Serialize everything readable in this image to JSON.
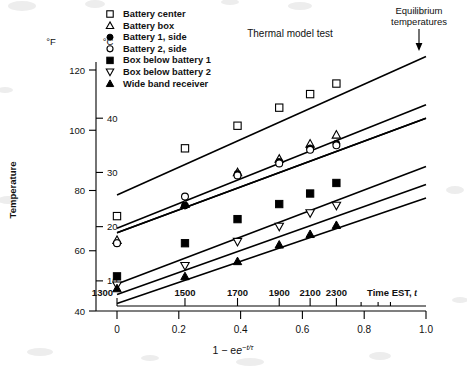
{
  "chart_data": {
    "type": "scatter",
    "title": "Thermal model test",
    "xlabel": "1 − e−t/τ",
    "xlabel_main": "1 − e",
    "xlabel_exp": "−t/τ",
    "ylabel": "Temperature",
    "y_axis_primary_unit": "°F",
    "y_axis_secondary_unit": "°C",
    "xlim": [
      -0.06,
      1.04
    ],
    "ylim_f": [
      40,
      126
    ],
    "grid": false,
    "legend_position": "top-left",
    "annotation": {
      "text_line1": "Equilibrium",
      "text_line2": "temperatures",
      "arrow": "down-arrow-to-curve-end"
    },
    "x_ticks": [
      {
        "value": 0,
        "label": "0"
      },
      {
        "value": 0.2,
        "label": "0.2"
      },
      {
        "value": 0.4,
        "label": "0.4"
      },
      {
        "value": 0.6,
        "label": "0.6"
      },
      {
        "value": 0.8,
        "label": "0.8"
      },
      {
        "value": 1.0,
        "label": "1.0"
      }
    ],
    "x_minor_ticks": [
      0.1,
      0.3,
      0.5,
      0.7,
      0.9
    ],
    "secondary_x_axis": {
      "label": "Time EST, t",
      "label_main": "Time EST,",
      "label_italic": "t",
      "ticks": [
        {
          "value": 0.0,
          "label": "1300"
        },
        {
          "value": 0.22,
          "label": "1500"
        },
        {
          "value": 0.39,
          "label": "1700"
        },
        {
          "value": 0.525,
          "label": "1900"
        },
        {
          "value": 0.625,
          "label": "2100"
        },
        {
          "value": 0.71,
          "label": "2300"
        }
      ],
      "extra_ticks": [
        0.79,
        0.845,
        0.885
      ]
    },
    "y_ticks_f": [
      {
        "value": 120,
        "label": "120"
      },
      {
        "value": 100,
        "label": "100"
      },
      {
        "value": 80,
        "label": "80"
      },
      {
        "value": 60,
        "label": "60"
      },
      {
        "value": 40,
        "label": "40"
      }
    ],
    "y_ticks_c": [
      {
        "value_f": 104,
        "value_c": 40,
        "label": "40"
      },
      {
        "value_f": 86,
        "value_c": 30,
        "label": "30"
      },
      {
        "value_f": 68,
        "value_c": 20,
        "label": "20"
      },
      {
        "value_f": 50,
        "value_c": 10,
        "label": "10"
      }
    ],
    "series": [
      {
        "name": "Battery center",
        "marker": "open-square",
        "line": {
          "x0": 0.0,
          "y0": 78.5,
          "x1": 1.0,
          "y1": 124.5
        },
        "points": [
          {
            "x": 0.0,
            "y": 71.5
          },
          {
            "x": 0.22,
            "y": 94.0
          },
          {
            "x": 0.39,
            "y": 101.5
          },
          {
            "x": 0.525,
            "y": 107.5
          },
          {
            "x": 0.625,
            "y": 112.0
          },
          {
            "x": 0.71,
            "y": 115.5
          }
        ]
      },
      {
        "name": "Battery box",
        "marker": "open-triangle-up",
        "line": {
          "x0": 0.0,
          "y0": 67.5,
          "x1": 1.0,
          "y1": 108.5
        },
        "points": [
          {
            "x": 0.0,
            "y": 63.5
          },
          {
            "x": 0.22,
            "y": 75.5
          },
          {
            "x": 0.39,
            "y": 86.0
          },
          {
            "x": 0.525,
            "y": 90.5
          },
          {
            "x": 0.625,
            "y": 95.5
          },
          {
            "x": 0.71,
            "y": 98.5
          }
        ]
      },
      {
        "name": "Battery 1, side",
        "marker": "filled-circle",
        "line": {
          "x0": 0.0,
          "y0": 66.0,
          "x1": 1.0,
          "y1": 104.0
        },
        "points": [
          {
            "x": 0.0,
            "y": 62.5
          },
          {
            "x": 0.22,
            "y": 75.0
          },
          {
            "x": 0.39,
            "y": 85.5
          },
          {
            "x": 0.525,
            "y": 89.5
          },
          {
            "x": 0.625,
            "y": 94.0
          },
          {
            "x": 0.71,
            "y": 95.5
          }
        ]
      },
      {
        "name": "Battery 2, side",
        "marker": "open-circle",
        "line": {
          "x0": 0.0,
          "y0": 66.0,
          "x1": 1.0,
          "y1": 104.0
        },
        "points": [
          {
            "x": 0.0,
            "y": 62.5
          },
          {
            "x": 0.22,
            "y": 78.0
          },
          {
            "x": 0.39,
            "y": 85.0
          },
          {
            "x": 0.525,
            "y": 89.0
          },
          {
            "x": 0.625,
            "y": 93.5
          },
          {
            "x": 0.71,
            "y": 95.0
          }
        ]
      },
      {
        "name": "Box below battery 1",
        "marker": "filled-square",
        "line": {
          "x0": 0.0,
          "y0": 49.0,
          "x1": 1.0,
          "y1": 88.0
        },
        "points": [
          {
            "x": 0.0,
            "y": 51.5
          },
          {
            "x": 0.22,
            "y": 62.5
          },
          {
            "x": 0.39,
            "y": 70.5
          },
          {
            "x": 0.525,
            "y": 75.5
          },
          {
            "x": 0.625,
            "y": 79.0
          },
          {
            "x": 0.71,
            "y": 82.5
          }
        ]
      },
      {
        "name": "Box below battery 2",
        "marker": "open-triangle-down",
        "line": {
          "x0": 0.0,
          "y0": 45.5,
          "x1": 1.0,
          "y1": 82.0
        },
        "points": [
          {
            "x": 0.0,
            "y": 48.5
          },
          {
            "x": 0.22,
            "y": 55.0
          },
          {
            "x": 0.39,
            "y": 63.0
          },
          {
            "x": 0.525,
            "y": 68.0
          },
          {
            "x": 0.625,
            "y": 72.5
          },
          {
            "x": 0.71,
            "y": 75.0
          }
        ]
      },
      {
        "name": "Wide band receiver",
        "marker": "filled-triangle-up",
        "line": {
          "x0": 0.0,
          "y0": 42.5,
          "x1": 1.0,
          "y1": 77.5
        },
        "points": [
          {
            "x": 0.0,
            "y": 47.5
          },
          {
            "x": 0.22,
            "y": 51.5
          },
          {
            "x": 0.39,
            "y": 56.5
          },
          {
            "x": 0.525,
            "y": 62.0
          },
          {
            "x": 0.625,
            "y": 65.5
          },
          {
            "x": 0.71,
            "y": 68.5
          }
        ]
      }
    ],
    "legend": [
      {
        "marker": "open-square",
        "label": "Battery center"
      },
      {
        "marker": "open-triangle-up",
        "label": "Battery box"
      },
      {
        "marker": "filled-circle",
        "label": "Battery 1, side"
      },
      {
        "marker": "open-circle",
        "label": "Battery 2, side"
      },
      {
        "marker": "filled-square",
        "label": "Box below battery 1"
      },
      {
        "marker": "open-triangle-down",
        "label": "Box below battery 2"
      },
      {
        "marker": "filled-triangle-up",
        "label": "Wide band receiver"
      }
    ]
  }
}
